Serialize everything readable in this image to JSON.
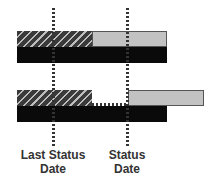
{
  "diagram": {
    "type": "status-date-schedule-illustration",
    "colors": {
      "completed_hatch": "#3a3a3a",
      "remaining": "#c2c2c2",
      "baseline": "#0a0a0a",
      "dotted_line": "#333333"
    },
    "rows": [
      {
        "name": "before-update",
        "segments": [
          {
            "kind": "completed",
            "pattern": "hatched"
          },
          {
            "kind": "remaining",
            "pattern": "solid-gray"
          }
        ],
        "baseline": "black-bar"
      },
      {
        "name": "after-update",
        "segments": [
          {
            "kind": "completed",
            "pattern": "hatched"
          },
          {
            "kind": "gap",
            "pattern": "dotted-connector"
          },
          {
            "kind": "remaining-rescheduled",
            "pattern": "solid-gray"
          }
        ],
        "baseline": "black-bar"
      }
    ],
    "markers": [
      {
        "label_line1": "Last Status",
        "label_line2": "Date"
      },
      {
        "label_line1": "Status",
        "label_line2": "Date"
      }
    ]
  }
}
